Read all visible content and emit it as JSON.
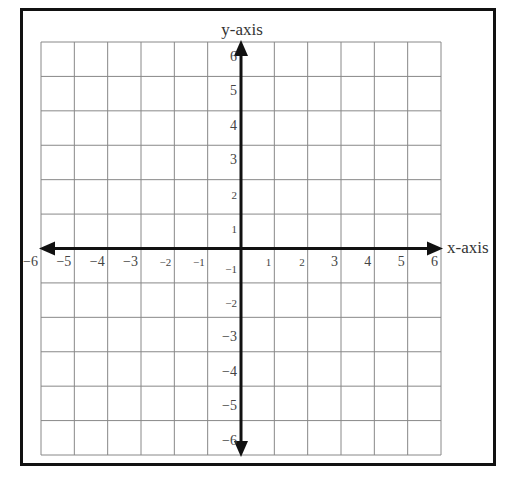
{
  "chart_data": {
    "type": "coordinate-grid",
    "title": "",
    "xlabel": "x-axis",
    "ylabel": "y-axis",
    "xlim": [
      -6,
      6
    ],
    "ylim": [
      -6,
      6
    ],
    "grid": true,
    "x_ticks": [
      -6,
      -5,
      -4,
      -3,
      -2,
      -1,
      1,
      2,
      3,
      4,
      5,
      6
    ],
    "y_ticks": [
      6,
      5,
      4,
      3,
      2,
      1,
      -1,
      -2,
      -3,
      -4,
      -5,
      -6
    ],
    "x_tick_labels": [
      "−6",
      "−5",
      "−4",
      "−3",
      "−2",
      "−1",
      "1",
      "2",
      "3",
      "4",
      "5",
      "6"
    ],
    "y_tick_labels": [
      "6",
      "5",
      "4",
      "3",
      "2",
      "1",
      "−1",
      "−2",
      "−3",
      "−4",
      "−5",
      "−6"
    ],
    "series": []
  },
  "labels": {
    "x_axis": "x-axis",
    "y_axis": "y-axis"
  },
  "colors": {
    "grid_line": "#888888",
    "axis_line": "#111111",
    "frame": "#111111",
    "text": "#444444"
  }
}
